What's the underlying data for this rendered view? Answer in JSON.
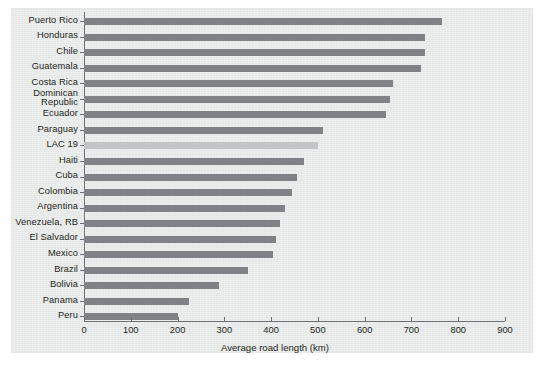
{
  "chart_data": {
    "type": "bar",
    "orientation": "horizontal",
    "title": "",
    "xlabel": "Average road length (km)",
    "ylabel": "",
    "xlim": [
      0,
      900
    ],
    "xticks": [
      0,
      100,
      200,
      300,
      400,
      500,
      600,
      700,
      800,
      900
    ],
    "xticklabels": [
      "0",
      "100",
      "200",
      "300",
      "400",
      "500",
      "600",
      "700",
      "800",
      "900"
    ],
    "grid": false,
    "legend": null,
    "categories": [
      "Puerto Rico",
      "Honduras",
      "Chile",
      "Guatemala",
      "Costa Rica",
      "Dominican\nRepublic",
      "Ecuador",
      "Paraguay",
      "LAC 19",
      "Haiti",
      "Cuba",
      "Colombia",
      "Argentina",
      "Venezuela, RB",
      "El Salvador",
      "Mexico",
      "Brazil",
      "Bolivia",
      "Panama",
      "Peru"
    ],
    "values": [
      765,
      730,
      728,
      720,
      660,
      655,
      645,
      510,
      500,
      470,
      455,
      445,
      430,
      420,
      410,
      405,
      350,
      288,
      225,
      200
    ],
    "highlight_category": "LAC 19",
    "colors": {
      "bar": "#808285",
      "bar_highlight": "#c3c5c7",
      "panel_background": "#e9eaea",
      "figure_background": "#ffffff",
      "axis": "#6d6e71",
      "text": "#231f20"
    }
  }
}
